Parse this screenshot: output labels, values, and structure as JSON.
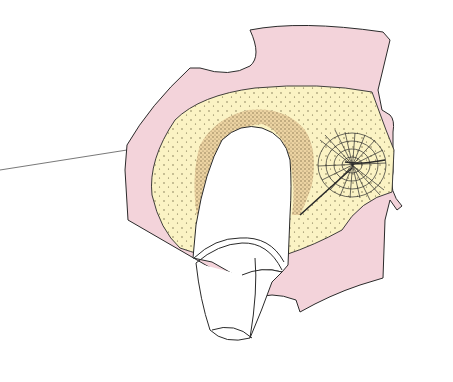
{
  "figure": {
    "type": "anatomical-illustration",
    "caption": "",
    "colors": {
      "background": "#ffffff",
      "soft_tissue_pink": "#f3d3da",
      "stippled_area_yellow": "#fbf3c4",
      "dense_band_tan": "#ecd3a2",
      "outline": "#2a2a2a",
      "implant_white": "#ffffff"
    },
    "elements": [
      {
        "name": "leader-line"
      },
      {
        "name": "pink-soft-tissue-flap"
      },
      {
        "name": "yellow-stippled-region"
      },
      {
        "name": "tan-dense-band"
      },
      {
        "name": "crosshatched-web-structure"
      },
      {
        "name": "white-finger-shaped-object"
      }
    ]
  }
}
